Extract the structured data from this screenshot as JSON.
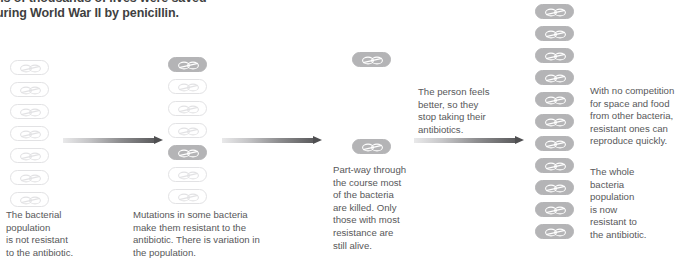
{
  "heading": {
    "text": "ns of thousands of lives were saved\nuring World War II by penicillin.",
    "note": "clipped-top-heading"
  },
  "colors": {
    "text": "#58585a",
    "heading": "#3f3f41",
    "resistant_fill": "#b4b4b6",
    "non_resistant_outline": "#e2e2e4",
    "arrow_dark": "#4f4f51",
    "arrow_light": "#e9e9ea",
    "background": "#ffffff"
  },
  "stages": [
    {
      "id": "stage-1",
      "caption": "The bacterial\npopulation\nis not resistant\nto the antibiotic.",
      "bacteria": [
        {
          "state": "non-resistant",
          "x": 10,
          "y": 60
        },
        {
          "state": "non-resistant",
          "x": 10,
          "y": 82
        },
        {
          "state": "non-resistant",
          "x": 10,
          "y": 104
        },
        {
          "state": "non-resistant",
          "x": 10,
          "y": 126
        },
        {
          "state": "non-resistant",
          "x": 10,
          "y": 148
        },
        {
          "state": "non-resistant",
          "x": 10,
          "y": 170
        },
        {
          "state": "non-resistant",
          "x": 10,
          "y": 192
        }
      ],
      "counts": {
        "resistant": 0,
        "non_resistant": 7
      }
    },
    {
      "id": "stage-2",
      "caption": "Mutations in some bacteria\nmake them resistant to the\nantibiotic. There is variation in\nthe population.",
      "bacteria": [
        {
          "state": "resistant",
          "x": 168,
          "y": 57
        },
        {
          "state": "non-resistant",
          "x": 168,
          "y": 79
        },
        {
          "state": "non-resistant",
          "x": 168,
          "y": 101
        },
        {
          "state": "non-resistant",
          "x": 168,
          "y": 123
        },
        {
          "state": "resistant",
          "x": 168,
          "y": 145
        },
        {
          "state": "non-resistant",
          "x": 168,
          "y": 167
        },
        {
          "state": "non-resistant",
          "x": 168,
          "y": 189
        }
      ],
      "counts": {
        "resistant": 2,
        "non_resistant": 5
      }
    },
    {
      "id": "stage-3",
      "caption": "Part-way through\nthe course most\nof the bacteria\nare killed. Only\nthose with most\nresistance are\nstill alive.",
      "bacteria": [
        {
          "state": "resistant",
          "x": 352,
          "y": 52
        },
        {
          "state": "resistant",
          "x": 352,
          "y": 139
        }
      ],
      "counts": {
        "resistant": 2,
        "non_resistant": 0
      }
    },
    {
      "id": "stage-4",
      "caption": "The whole\nbacteria\npopulation\nis now\nresistant to\nthe antibiotic.",
      "bacteria": [
        {
          "state": "resistant",
          "x": 535,
          "y": 4
        },
        {
          "state": "resistant",
          "x": 535,
          "y": 26
        },
        {
          "state": "resistant",
          "x": 535,
          "y": 48
        },
        {
          "state": "resistant",
          "x": 535,
          "y": 70
        },
        {
          "state": "resistant",
          "x": 535,
          "y": 92
        },
        {
          "state": "resistant",
          "x": 535,
          "y": 114
        },
        {
          "state": "resistant",
          "x": 535,
          "y": 136
        },
        {
          "state": "resistant",
          "x": 535,
          "y": 158
        },
        {
          "state": "resistant",
          "x": 535,
          "y": 180
        },
        {
          "state": "resistant",
          "x": 535,
          "y": 202
        },
        {
          "state": "resistant",
          "x": 535,
          "y": 224
        }
      ],
      "counts": {
        "resistant": 11,
        "non_resistant": 0
      }
    }
  ],
  "arrows": [
    {
      "id": "arrow-1",
      "x": 63,
      "y": 136,
      "length": 100
    },
    {
      "id": "arrow-2",
      "x": 222,
      "y": 136,
      "length": 100
    },
    {
      "id": "arrow-3",
      "x": 414,
      "y": 136,
      "length": 110
    }
  ],
  "annotations": [
    {
      "id": "annotation-stop-antibiotics",
      "text": "The person feels\nbetter, so they\nstop taking their\nantibiotics.",
      "x": 418,
      "y": 86,
      "width": 115
    },
    {
      "id": "annotation-no-competition",
      "text": "With no competition\nfor space and food\nfrom other bacteria,\nresistant ones can\nreproduce quickly.",
      "x": 590,
      "y": 85,
      "width": 96
    }
  ],
  "caption_positions": [
    {
      "id": "caption-1",
      "x": 6,
      "y": 209,
      "width": 110
    },
    {
      "id": "caption-2",
      "x": 133,
      "y": 209,
      "width": 160
    },
    {
      "id": "caption-3",
      "x": 333,
      "y": 164,
      "width": 100
    },
    {
      "id": "caption-4",
      "x": 590,
      "y": 166,
      "width": 95
    }
  ]
}
